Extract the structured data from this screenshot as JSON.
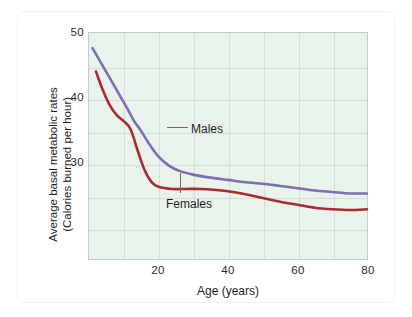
{
  "chart_data": {
    "type": "line",
    "title": "",
    "xlabel": "Age (years)",
    "ylabel": "Average basal metabolic rates\n(Calories burned per hour)",
    "ylabel_line1": "Average basal metabolic rates",
    "ylabel_line2": "(Calories burned per hour)",
    "xlim": [
      0,
      80
    ],
    "ylim": [
      25,
      55
    ],
    "xticks": [
      20,
      40,
      60,
      80
    ],
    "yticks": [
      30,
      40,
      50
    ],
    "xtick_labels": [
      "20",
      "40",
      "60",
      "80"
    ],
    "ytick_labels": [
      "30",
      "40",
      "50"
    ],
    "grid": true,
    "grid_x_step": 10,
    "grid_y_step": 5,
    "legend_position": "inline-annotations",
    "series": [
      {
        "name": "Males",
        "color": "#7b6fb0",
        "x": [
          1,
          3,
          5,
          7,
          9,
          11,
          13,
          15,
          17,
          20,
          23,
          26,
          30,
          35,
          40,
          45,
          50,
          55,
          60,
          65,
          70,
          75,
          80
        ],
        "values": [
          53.0,
          51.4,
          49.8,
          48.2,
          46.6,
          45.0,
          43.3,
          42.0,
          40.5,
          38.6,
          37.4,
          36.7,
          36.2,
          35.8,
          35.5,
          35.2,
          35.0,
          34.7,
          34.4,
          34.1,
          33.9,
          33.7,
          33.7
        ]
      },
      {
        "name": "Females",
        "color": "#a62b33",
        "x": [
          2,
          4,
          6,
          8,
          10,
          12,
          14,
          16,
          18,
          20,
          24,
          28,
          32,
          36,
          40,
          45,
          50,
          55,
          60,
          65,
          70,
          75,
          80
        ],
        "values": [
          49.9,
          47.4,
          45.4,
          44.1,
          43.3,
          42.2,
          39.4,
          36.8,
          35.2,
          34.6,
          34.3,
          34.3,
          34.3,
          34.2,
          34.0,
          33.6,
          33.1,
          32.6,
          32.2,
          31.8,
          31.6,
          31.5,
          31.6
        ]
      }
    ],
    "annotations": [
      {
        "label": "Males",
        "series": "Males",
        "leader": "horizontal"
      },
      {
        "label": "Females",
        "series": "Females",
        "leader": "vertical"
      }
    ],
    "colors": {
      "males": "#7b6fb0",
      "females": "#a62b33",
      "plot_background": "#eaf2ec",
      "gridline": "#d3ded7",
      "plot_border": "#c3cdc8",
      "page_background": "#ffffff"
    }
  }
}
